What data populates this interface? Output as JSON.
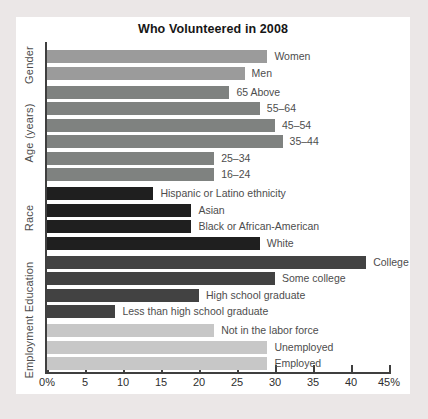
{
  "title": "Who Volunteered in 2008",
  "colors": {
    "page_background": "#ebe7e7",
    "panel_background": "#ffffff",
    "axis": "#3f3f3f",
    "title_text": "#161616",
    "label_text": "#4d4d4d",
    "gender_bars": "#9b9b9b",
    "age_bars": "#7f8280",
    "race_bars": "#1f1f1f",
    "education_bars": "#424242",
    "employment_bars": "#c7c7c7"
  },
  "chart_data": {
    "type": "bar",
    "orientation": "horizontal",
    "title": "Who Volunteered in 2008",
    "unit": "percent",
    "xlim": [
      0,
      45
    ],
    "x_tick_step": 5,
    "x_tick_labels": [
      "0%",
      "5",
      "10",
      "15",
      "20",
      "25",
      "30",
      "35",
      "40",
      "45%"
    ],
    "grid": false,
    "legend": false,
    "value_labels": "category name at end of each bar",
    "groups": [
      {
        "name": "Gender",
        "color": "#9b9b9b",
        "bars": [
          {
            "label": "Women",
            "value": 29
          },
          {
            "label": "Men",
            "value": 26
          }
        ]
      },
      {
        "name": "Age (years)",
        "color": "#7f8280",
        "bars": [
          {
            "label": "65 Above",
            "value": 24
          },
          {
            "label": "55–64",
            "value": 28
          },
          {
            "label": "45–54",
            "value": 30
          },
          {
            "label": "35–44",
            "value": 31
          },
          {
            "label": "25–34",
            "value": 22
          },
          {
            "label": "16–24",
            "value": 22
          }
        ]
      },
      {
        "name": "Race",
        "color": "#1f1f1f",
        "bars": [
          {
            "label": "Hispanic or Latino ethnicity",
            "value": 14
          },
          {
            "label": "Asian",
            "value": 19
          },
          {
            "label": "Black or African-American",
            "value": 19
          },
          {
            "label": "White",
            "value": 28
          }
        ]
      },
      {
        "name": "Education",
        "color": "#424242",
        "bars": [
          {
            "label": "College",
            "value": 42
          },
          {
            "label": "Some college",
            "value": 30
          },
          {
            "label": "High school graduate",
            "value": 20
          },
          {
            "label": "Less than high school graduate",
            "value": 9
          }
        ]
      },
      {
        "name": "Employment",
        "color": "#c7c7c7",
        "bars": [
          {
            "label": "Not in the labor force",
            "value": 22
          },
          {
            "label": "Unemployed",
            "value": 29
          },
          {
            "label": "Employed",
            "value": 29
          }
        ]
      }
    ]
  }
}
